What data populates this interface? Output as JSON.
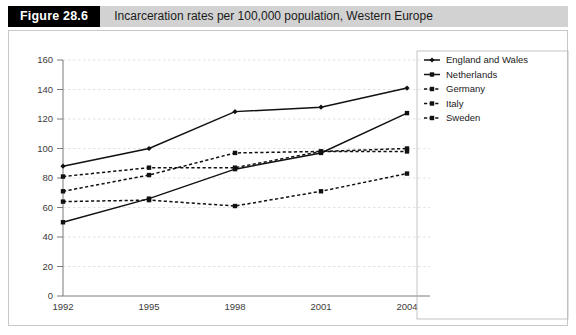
{
  "header": {
    "figure_tag": "Figure 28.6",
    "title": "Incarceration rates per 100,000 population, Western Europe"
  },
  "legend": {
    "items": [
      {
        "label": "England and Wales",
        "style": "solid",
        "color": "#111111"
      },
      {
        "label": "Netherlands",
        "style": "solid",
        "color": "#111111"
      },
      {
        "label": "Germany",
        "style": "dashed",
        "color": "#111111"
      },
      {
        "label": "Italy",
        "style": "dashed",
        "color": "#111111"
      },
      {
        "label": "Sweden",
        "style": "dashed",
        "color": "#111111"
      }
    ]
  },
  "axes": {
    "y_ticks": [
      "0",
      "20",
      "40",
      "60",
      "80",
      "100",
      "120",
      "140",
      "160"
    ],
    "x_ticks": [
      "1992",
      "1995",
      "1998",
      "2001",
      "2004"
    ]
  },
  "chart_data": {
    "type": "line",
    "title": "Incarceration rates per 100,000 population, Western Europe",
    "xlabel": "",
    "ylabel": "",
    "x": [
      "1992",
      "1995",
      "1998",
      "2001",
      "2004"
    ],
    "categories": [
      "1992",
      "1995",
      "1998",
      "2001",
      "2004"
    ],
    "ylim": [
      0,
      160
    ],
    "ytick_step": 20,
    "grid": true,
    "legend_position": "right",
    "series": [
      {
        "name": "England and Wales",
        "style": "solid",
        "marker": "diamond",
        "values": [
          88,
          100,
          125,
          128,
          141
        ]
      },
      {
        "name": "Netherlands",
        "style": "solid",
        "marker": "square",
        "values": [
          50,
          66,
          86,
          97,
          124
        ]
      },
      {
        "name": "Germany",
        "style": "dashed",
        "marker": "square",
        "values": [
          81,
          87,
          87,
          98,
          100
        ]
      },
      {
        "name": "Italy",
        "style": "dashed",
        "marker": "square",
        "values": [
          71,
          82,
          97,
          98,
          98
        ]
      },
      {
        "name": "Sweden",
        "style": "dashed",
        "marker": "square",
        "values": [
          64,
          65,
          61,
          71,
          83
        ]
      }
    ]
  }
}
